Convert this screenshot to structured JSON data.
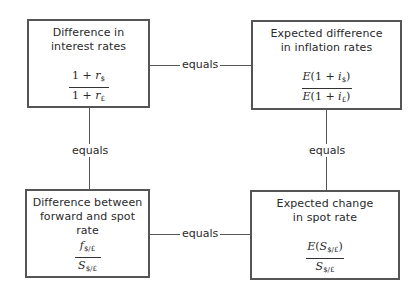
{
  "boxes": {
    "interest": {
      "title_line1": "Difference in",
      "title_line2": "interest rates",
      "formula": {
        "num_prefix": "1 + ",
        "num_var": "r",
        "num_sub": "$",
        "den_prefix": "1 + ",
        "den_var": "r",
        "den_sub": "£"
      }
    },
    "inflation": {
      "title_line1": "Expected difference",
      "title_line2": "in inflation rates",
      "formula": {
        "num_prefix": "(1 + ",
        "num_var": "i",
        "num_sub": "$",
        "num_suffix": ")",
        "den_prefix": "(1 + ",
        "den_var": "i",
        "den_sub": "£",
        "den_suffix": ")",
        "expect": "E"
      }
    },
    "forward": {
      "title_line1": "Difference between",
      "title_line2": "forward and spot rate",
      "formula": {
        "num_var": "f",
        "num_sub": "$/£",
        "den_var": "S",
        "den_sub": "$/£"
      }
    },
    "spot": {
      "title_line1": "Expected change",
      "title_line2": "in spot rate",
      "formula": {
        "expect": "E",
        "num_open": "(",
        "num_var": "S",
        "num_sub": "$/£",
        "num_close": ")",
        "den_var": "S",
        "den_sub": "$/£"
      }
    }
  },
  "connectors": {
    "top": "equals",
    "bottom": "equals",
    "left": "equals",
    "right": "equals"
  }
}
